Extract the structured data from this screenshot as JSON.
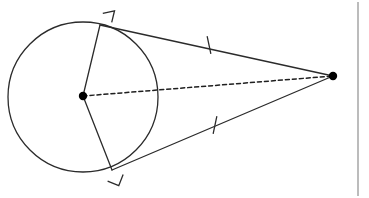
{
  "figure": {
    "kind": "geometry-diagram",
    "canvas": {
      "width": 369,
      "height": 198,
      "background": "#ffffff"
    },
    "style": {
      "stroke_color": "#2b2b2b",
      "stroke_width": 1.3,
      "dashed_stroke_color": "#1f1f1f",
      "dash_pattern": "4 3",
      "point_fill": "#000000",
      "border_line_color": "#8f8f8f"
    },
    "circle": {
      "name": "circle",
      "center_x": 83,
      "center_y": 97,
      "radius": 75
    },
    "points": [
      {
        "id": "center",
        "name": "circle-center-point",
        "x": 83,
        "y": 96,
        "dot_radius": 4.2
      },
      {
        "id": "external",
        "name": "external-point",
        "x": 333,
        "y": 76,
        "dot_radius": 4.2
      },
      {
        "id": "tangent-upper",
        "name": "upper-tangency-point",
        "x": 100,
        "y": 25,
        "dot_radius": 0
      },
      {
        "id": "tangent-lower",
        "name": "lower-tangency-point",
        "x": 112,
        "y": 170,
        "dot_radius": 0
      }
    ],
    "segments": [
      {
        "id": "radius-upper",
        "name": "upper-radius-segment",
        "x1": 83,
        "y1": 96,
        "x2": 100,
        "y2": 25,
        "dashed": false
      },
      {
        "id": "radius-lower",
        "name": "lower-radius-segment",
        "x1": 83,
        "y1": 96,
        "x2": 112,
        "y2": 170,
        "dashed": false
      },
      {
        "id": "tangent-upper",
        "name": "upper-tangent-segment",
        "x1": 100,
        "y1": 25,
        "x2": 333,
        "y2": 76,
        "dashed": false
      },
      {
        "id": "tangent-lower",
        "name": "lower-tangent-segment",
        "x1": 112,
        "y1": 170,
        "x2": 333,
        "y2": 76,
        "dashed": false
      },
      {
        "id": "center-to-external",
        "name": "center-to-external-dashed-segment",
        "x1": 83,
        "y1": 96,
        "x2": 333,
        "y2": 76,
        "dashed": true
      }
    ],
    "right_angle_marks": [
      {
        "id": "ra-upper",
        "name": "upper-right-angle-mark",
        "vertex_x": 100,
        "vertex_y": 25,
        "size": 12,
        "arm1_angle_deg": 76.5,
        "arm2_angle_deg": 12.4
      },
      {
        "id": "ra-lower",
        "name": "lower-right-angle-mark",
        "vertex_x": 112,
        "vertex_y": 170,
        "size": 12,
        "arm1_angle_deg": 248.6,
        "arm2_angle_deg": 338.2
      }
    ],
    "congruence_ticks": [
      {
        "id": "tick-upper",
        "name": "upper-congruence-tick",
        "x": 209,
        "y": 45,
        "length": 17,
        "angle_deg": 102
      },
      {
        "id": "tick-lower",
        "name": "lower-congruence-tick",
        "x": 215,
        "y": 125,
        "length": 17,
        "angle_deg": 78
      }
    ],
    "border_lines": [
      {
        "id": "right-rule",
        "name": "right-edge-vertical-rule",
        "x1": 358,
        "y1": 2,
        "x2": 358,
        "y2": 196
      }
    ],
    "labels": []
  }
}
